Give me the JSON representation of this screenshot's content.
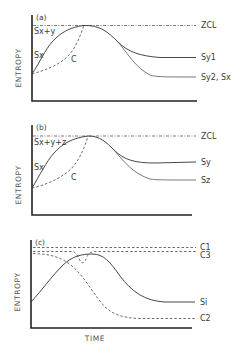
{
  "figure": {
    "y_axis_label": "ENTROPY",
    "x_axis_label": "TIME",
    "panels": [
      {
        "id": "a",
        "tag": "(a)",
        "labels": {
          "peak": "Sx+y",
          "start": "Sx",
          "cumulative": "C",
          "reference": "ZCL",
          "end_upper": "Sy1",
          "end_lower": "Sy2, Sx"
        }
      },
      {
        "id": "b",
        "tag": "(b)",
        "labels": {
          "peak": "Sx+y+z",
          "start": "Sx",
          "cumulative": "C",
          "reference": "ZCL",
          "end_upper": "Sy",
          "end_lower": "Sz"
        }
      },
      {
        "id": "c",
        "tag": "(c)",
        "labels": {
          "ref_top": "C1",
          "ref_second": "C3",
          "entropy_curve": "Si",
          "decay_curve": "C2"
        }
      }
    ]
  }
}
